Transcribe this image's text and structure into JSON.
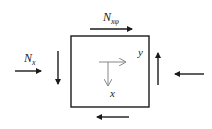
{
  "diagram": {
    "labels": {
      "shear_force": "N",
      "shear_sub": "xφ",
      "normal_force": "N",
      "normal_sub": "x",
      "axis_x": "x",
      "axis_y": "y"
    },
    "colors": {
      "stroke": "#1a1a1a",
      "inner_axes": "#888888",
      "background": "#ffffff"
    },
    "arrows": [
      {
        "name": "top-shear-arrow",
        "direction": "right"
      },
      {
        "name": "bottom-shear-arrow",
        "direction": "left"
      },
      {
        "name": "left-normal-arrow",
        "direction": "right"
      },
      {
        "name": "right-normal-arrow",
        "direction": "left"
      },
      {
        "name": "left-shear-arrow",
        "direction": "down"
      },
      {
        "name": "right-shear-arrow",
        "direction": "up"
      }
    ]
  }
}
